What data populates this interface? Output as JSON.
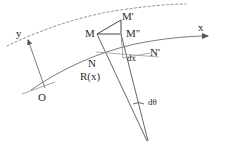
{
  "figure": {
    "background_color": "#ffffff",
    "stroke_color": "#555555",
    "text_color": "#2b2b2b",
    "axes": {
      "x_label": "x",
      "y_label": "y",
      "origin_label": "O"
    },
    "points": {
      "m": "M",
      "m_prime": "M'",
      "m_double_prime": "M\"",
      "n": "N",
      "n_prime": "N'"
    },
    "annotations": {
      "radius": "R(x)",
      "dx": "dx",
      "dtheta": "dθ"
    },
    "curves": {
      "deformed_label": "deformed-curve-dashed",
      "neutral_label": "neutral-axis-solid"
    }
  }
}
